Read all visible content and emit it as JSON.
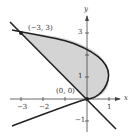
{
  "figure": {
    "type": "region between curves",
    "curves": [
      {
        "name": "parabola",
        "equation": "x = 2y - y^2",
        "vertex": [
          1,
          1
        ]
      },
      {
        "name": "line",
        "equation": "y = -x"
      }
    ],
    "intersection_points": [
      {
        "label": "(−3, 3)",
        "x": -3,
        "y": 3
      },
      {
        "label": "(0, 0)",
        "x": 0,
        "y": 0
      }
    ],
    "axes": {
      "x_label": "x",
      "y_label": "y",
      "x_ticks": [
        "−3",
        "−2",
        "1"
      ],
      "y_ticks": [
        "3",
        "1",
        "−1"
      ]
    },
    "shaded_region_color": "#d4d4d4",
    "curve_color": "#222222"
  }
}
